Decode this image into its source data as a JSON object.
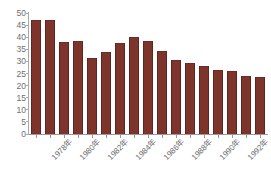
{
  "chart_data": {
    "type": "bar",
    "title": "",
    "subtitle": "",
    "xlabel": "",
    "ylabel": "",
    "categories": [
      "1978年",
      "1979年",
      "1980年",
      "1981年",
      "1982年",
      "1983年",
      "1984年",
      "1985年",
      "1986年",
      "1987年",
      "1988年",
      "1989年",
      "1990年",
      "1991年",
      "1992年",
      "1993年",
      "1994年"
    ],
    "values": [
      47,
      47,
      38,
      38.5,
      31.5,
      34,
      37.5,
      40,
      38.5,
      34.5,
      30.5,
      29.5,
      28,
      26.5,
      26,
      24,
      23.5
    ],
    "ylim": [
      0,
      50
    ],
    "ytick_step": 5,
    "yticks": [
      50,
      45,
      40,
      35,
      30,
      25,
      20,
      15,
      10,
      5,
      0
    ],
    "ytick_labels": [
      "50",
      "45",
      "40",
      "35",
      "30",
      "25",
      "20",
      "15",
      "10",
      "5",
      "0"
    ],
    "xtick_labels_shown": [
      "1978年",
      "1980年",
      "1982年",
      "1984年",
      "1986年",
      "1988年",
      "1990年",
      "1992年",
      "1994年"
    ],
    "xtick_label_indices": [
      0,
      2,
      4,
      6,
      8,
      10,
      12,
      14,
      16
    ],
    "grid": false,
    "legend": null,
    "bar_color": "#7d342a",
    "axis_color": "#a8a8a8",
    "tick_label_color": "#6e6e6e",
    "background_color": "#ffffff"
  }
}
